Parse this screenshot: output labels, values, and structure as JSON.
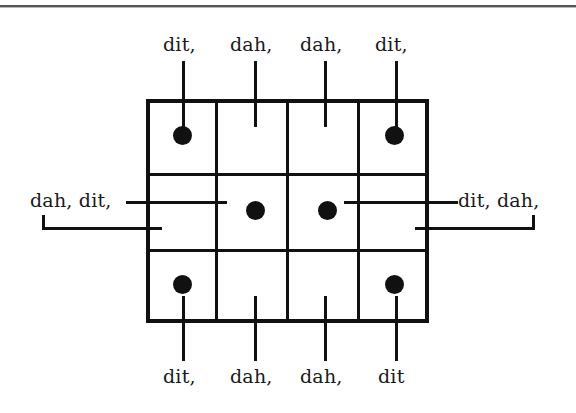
{
  "figure": {
    "type": "morse-code-grid-diagram",
    "title": "",
    "grid": {
      "columns": 4,
      "rows": 3,
      "dots": [
        {
          "row": 1,
          "col": 1
        },
        {
          "row": 1,
          "col": 4
        },
        {
          "row": 2,
          "col": 2
        },
        {
          "row": 2,
          "col": 3
        },
        {
          "row": 3,
          "col": 1
        },
        {
          "row": 3,
          "col": 4
        }
      ]
    },
    "labels": {
      "top": [
        "dit,",
        "dah,",
        "dah,",
        "dit,"
      ],
      "bottom": [
        "dit,",
        "dah,",
        "dah,",
        "dit"
      ],
      "left": "dah, dit,",
      "right": "dit, dah,"
    }
  },
  "colors": {
    "ink": "#111111",
    "paper": "#ffffff",
    "rule": "#555555"
  }
}
